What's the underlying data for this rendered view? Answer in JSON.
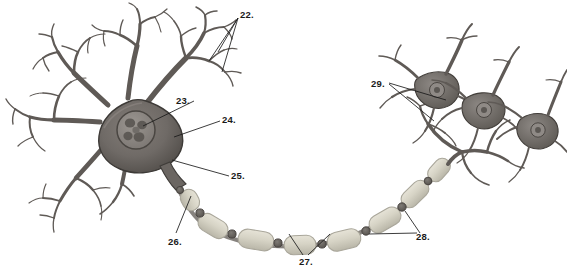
{
  "figure": {
    "background_color": "#ffffff",
    "label_color": "#1a1a1a",
    "soma_color": "#6f6a66",
    "soma_edge_color": "#3d3a37",
    "nucleus_color": "#8d8884",
    "nucleolus_color": "#56524e",
    "dendrite_color": "#5f5a56",
    "myelin_color": "#d8d5c8",
    "myelin_edge_color": "#a9a69a",
    "node_color": "#6a6661",
    "axon_color": "#7a7671",
    "target_neuron_color": "#7b7672"
  },
  "labels": [
    {
      "id": "22",
      "text": "22.",
      "x": 240,
      "y": 10,
      "refers_to": "dendrite-branches",
      "leader_count": 3
    },
    {
      "id": "23",
      "text": "23.",
      "x": 176,
      "y": 96,
      "refers_to": "nucleus",
      "leader_count": 1
    },
    {
      "id": "24",
      "text": "24.",
      "x": 222,
      "y": 115,
      "refers_to": "cell-body-soma",
      "leader_count": 1
    },
    {
      "id": "25",
      "text": "25.",
      "x": 231,
      "y": 171,
      "refers_to": "axon-hillock",
      "leader_count": 1
    },
    {
      "id": "26",
      "text": "26.",
      "x": 168,
      "y": 237,
      "refers_to": "axon",
      "leader_count": 1
    },
    {
      "id": "27",
      "text": "27.",
      "x": 299,
      "y": 257,
      "refers_to": "myelin-sheath-internode",
      "leader_count": 2
    },
    {
      "id": "28",
      "text": "28.",
      "x": 416,
      "y": 232,
      "refers_to": "node-of-ranvier",
      "leader_count": 2
    },
    {
      "id": "29",
      "text": "29.",
      "x": 371,
      "y": 79,
      "refers_to": "axon-terminals",
      "leader_count": 2
    }
  ],
  "structures": {
    "dendrite_count": 5,
    "myelin_segment_count": 8,
    "node_count": 8,
    "target_neuron_count": 3
  }
}
